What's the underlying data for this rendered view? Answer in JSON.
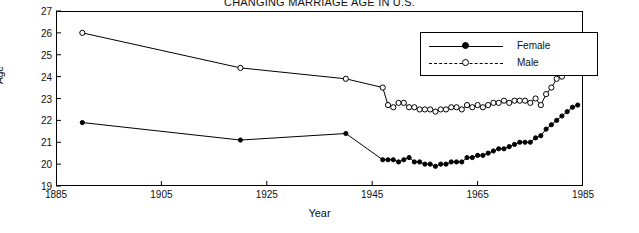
{
  "chart_data": {
    "type": "line",
    "title": "CHANGING MARRIAGE AGE IN U.S.",
    "xlabel": "Year",
    "ylabel": "Age",
    "xlim": [
      1885,
      1985
    ],
    "ylim": [
      19,
      27
    ],
    "xticks": [
      1885,
      1905,
      1925,
      1945,
      1965,
      1985
    ],
    "yticks": [
      19,
      20,
      21,
      22,
      23,
      24,
      25,
      26,
      27
    ],
    "grid": false,
    "legend_position": "top-right",
    "series": [
      {
        "name": "Female",
        "marker": "filled-circle",
        "points": [
          [
            1890,
            21.9
          ],
          [
            1920,
            21.1
          ],
          [
            1940,
            21.4
          ],
          [
            1947,
            20.2
          ],
          [
            1948,
            20.2
          ],
          [
            1949,
            20.2
          ],
          [
            1950,
            20.1
          ],
          [
            1951,
            20.2
          ],
          [
            1952,
            20.3
          ],
          [
            1953,
            20.1
          ],
          [
            1954,
            20.1
          ],
          [
            1955,
            20.0
          ],
          [
            1956,
            20.0
          ],
          [
            1957,
            19.9
          ],
          [
            1958,
            20.0
          ],
          [
            1959,
            20.0
          ],
          [
            1960,
            20.1
          ],
          [
            1961,
            20.1
          ],
          [
            1962,
            20.1
          ],
          [
            1963,
            20.3
          ],
          [
            1964,
            20.3
          ],
          [
            1965,
            20.4
          ],
          [
            1966,
            20.4
          ],
          [
            1967,
            20.5
          ],
          [
            1968,
            20.6
          ],
          [
            1969,
            20.7
          ],
          [
            1970,
            20.7
          ],
          [
            1971,
            20.8
          ],
          [
            1972,
            20.9
          ],
          [
            1973,
            21.0
          ],
          [
            1974,
            21.0
          ],
          [
            1975,
            21.0
          ],
          [
            1976,
            21.2
          ],
          [
            1977,
            21.3
          ],
          [
            1978,
            21.6
          ],
          [
            1979,
            21.8
          ],
          [
            1980,
            22.0
          ],
          [
            1981,
            22.2
          ],
          [
            1982,
            22.4
          ],
          [
            1983,
            22.6
          ],
          [
            1984,
            22.7
          ]
        ]
      },
      {
        "name": "Male",
        "marker": "open-circle",
        "points": [
          [
            1890,
            26.0
          ],
          [
            1920,
            24.4
          ],
          [
            1940,
            23.9
          ],
          [
            1947,
            23.5
          ],
          [
            1948,
            22.7
          ],
          [
            1949,
            22.6
          ],
          [
            1950,
            22.8
          ],
          [
            1951,
            22.8
          ],
          [
            1952,
            22.6
          ],
          [
            1953,
            22.6
          ],
          [
            1954,
            22.5
          ],
          [
            1955,
            22.5
          ],
          [
            1956,
            22.5
          ],
          [
            1957,
            22.4
          ],
          [
            1958,
            22.5
          ],
          [
            1959,
            22.5
          ],
          [
            1960,
            22.6
          ],
          [
            1961,
            22.6
          ],
          [
            1962,
            22.5
          ],
          [
            1963,
            22.7
          ],
          [
            1964,
            22.6
          ],
          [
            1965,
            22.7
          ],
          [
            1966,
            22.6
          ],
          [
            1967,
            22.7
          ],
          [
            1968,
            22.8
          ],
          [
            1969,
            22.8
          ],
          [
            1970,
            22.9
          ],
          [
            1971,
            22.8
          ],
          [
            1972,
            22.9
          ],
          [
            1973,
            22.9
          ],
          [
            1974,
            22.9
          ],
          [
            1975,
            22.8
          ],
          [
            1976,
            23.0
          ],
          [
            1977,
            22.7
          ],
          [
            1978,
            23.2
          ],
          [
            1979,
            23.5
          ],
          [
            1980,
            23.9
          ],
          [
            1981,
            24.0
          ],
          [
            1982,
            24.2
          ],
          [
            1983,
            24.4
          ],
          [
            1984,
            24.5
          ]
        ]
      }
    ]
  },
  "legend": {
    "female_label": "Female",
    "male_label": "Male"
  },
  "axes": {
    "x_title": "Year",
    "y_title": "Age"
  }
}
